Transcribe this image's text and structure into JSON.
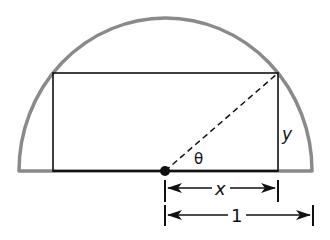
{
  "diagram": {
    "labels": {
      "theta": "θ",
      "x": "x",
      "y": "y",
      "radius": "1"
    },
    "colors": {
      "semicircle": "#8a8a8a",
      "lines": "#111111",
      "background": "#ffffff"
    }
  }
}
